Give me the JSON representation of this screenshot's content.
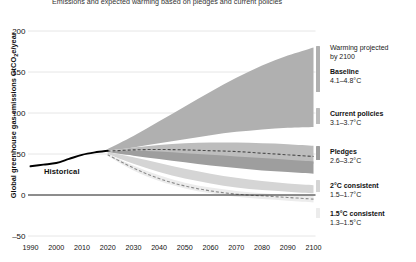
{
  "title": "Emissions and expected warming based on pledges and current policies",
  "axes": {
    "ylabel_pre": "Global greenhouse gas emissions GtCO",
    "ylabel_sub": "2",
    "ylabel_post": "e/year",
    "yticks": [
      "200",
      "150",
      "100",
      "50",
      "0",
      "-50"
    ],
    "xticks": [
      "1990",
      "2000",
      "2010",
      "2020",
      "2030",
      "2040",
      "2050",
      "2060",
      "2070",
      "2080",
      "2090",
      "2100"
    ]
  },
  "annotations": {
    "historical": "Historical"
  },
  "legend": {
    "heading_line1": "Warming projected",
    "heading_line2": "by 2100",
    "items": [
      {
        "name": "Baseline",
        "value": "4.1–4.8°C",
        "color": "#b0b0b0"
      },
      {
        "name": "Current policies",
        "value": "3.1–3.7°C",
        "color": "#bdbdbd"
      },
      {
        "name": "Pledges",
        "value": "2.6–3.2°C",
        "color": "#9e9e9e"
      },
      {
        "name": "2°C consistent",
        "value": "1.5–1.7°C",
        "color": "#d5d5d5"
      },
      {
        "name": "1.5°C consistent",
        "value": "1.3–1.5°C",
        "color": "#ececec"
      }
    ]
  },
  "chart_data": {
    "type": "area",
    "title": "Emissions and expected warming based on pledges and current policies",
    "xlabel": "",
    "ylabel": "Global greenhouse gas emissions GtCO2e/year",
    "xlim": [
      1990,
      2100
    ],
    "ylim": [
      -50,
      200
    ],
    "grid": true,
    "legend_position": "right",
    "x": [
      1990,
      2000,
      2010,
      2020,
      2030,
      2040,
      2050,
      2060,
      2070,
      2080,
      2090,
      2100
    ],
    "series": [
      {
        "name": "Historical",
        "type": "line",
        "color": "#000000",
        "x": [
          1990,
          1995,
          2000,
          2005,
          2010,
          2015,
          2020
        ],
        "values": [
          35,
          37,
          39,
          44,
          49,
          52,
          54
        ]
      },
      {
        "name": "Baseline",
        "type": "band",
        "color": "#b0b0b0",
        "warming": "4.1-4.8",
        "x": [
          2020,
          2030,
          2040,
          2050,
          2060,
          2070,
          2080,
          2090,
          2100
        ],
        "upper": [
          56,
          72,
          90,
          108,
          126,
          143,
          158,
          170,
          180
        ],
        "lower": [
          54,
          58,
          63,
          68,
          73,
          77,
          80,
          82,
          83
        ]
      },
      {
        "name": "Current policies",
        "type": "band",
        "color": "#bdbdbd",
        "warming": "3.1-3.7",
        "x": [
          2020,
          2030,
          2040,
          2050,
          2060,
          2070,
          2080,
          2090,
          2100
        ],
        "upper": [
          54,
          58,
          61,
          63,
          64,
          64,
          63,
          62,
          60
        ],
        "lower": [
          53,
          52,
          50,
          48,
          46,
          44,
          42,
          40,
          38
        ]
      },
      {
        "name": "Pledges",
        "type": "band",
        "color": "#9e9e9e",
        "warming": "2.6-3.2",
        "x": [
          2020,
          2030,
          2040,
          2050,
          2060,
          2070,
          2080,
          2090,
          2100
        ],
        "upper": [
          53,
          54,
          53,
          51,
          49,
          47,
          45,
          43,
          41
        ],
        "lower": [
          52,
          48,
          44,
          40,
          36,
          33,
          30,
          28,
          26
        ]
      },
      {
        "name": "2°C consistent",
        "type": "band",
        "color": "#d5d5d5",
        "warming": "1.5-1.7",
        "x": [
          2020,
          2030,
          2040,
          2050,
          2060,
          2070,
          2080,
          2090,
          2100
        ],
        "upper": [
          52,
          46,
          39,
          32,
          26,
          21,
          17,
          14,
          12
        ],
        "lower": [
          50,
          38,
          28,
          20,
          14,
          9,
          6,
          4,
          2
        ]
      },
      {
        "name": "1.5°C consistent",
        "type": "band",
        "color": "#ececec",
        "warming": "1.3-1.5",
        "x": [
          2020,
          2030,
          2040,
          2050,
          2060,
          2070,
          2080,
          2090,
          2100
        ],
        "upper": [
          50,
          36,
          24,
          15,
          9,
          5,
          2,
          0,
          -1
        ],
        "lower": [
          48,
          30,
          17,
          8,
          2,
          -2,
          -5,
          -7,
          -9
        ]
      }
    ],
    "median_lines": [
      {
        "name": "Current policies median",
        "style": "dashed",
        "color": "#4a4a4a",
        "x": [
          2020,
          2030,
          2040,
          2050,
          2060,
          2070,
          2080,
          2090,
          2100
        ],
        "values": [
          53.5,
          55,
          55.5,
          55,
          54,
          53,
          51,
          49,
          47
        ]
      },
      {
        "name": "1.5°C median",
        "style": "dashed",
        "color": "#8a8a8a",
        "x": [
          2020,
          2030,
          2040,
          2050,
          2060,
          2070,
          2080,
          2090,
          2100
        ],
        "values": [
          49,
          33,
          20,
          11,
          5,
          1,
          -1,
          -3,
          -5
        ]
      }
    ]
  }
}
